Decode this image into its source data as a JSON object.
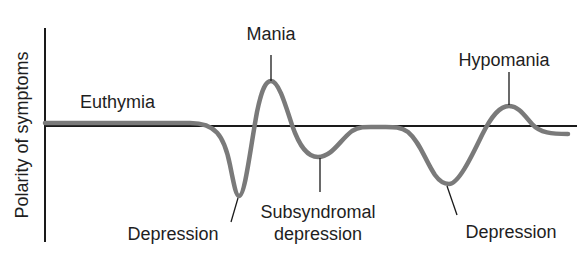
{
  "diagram": {
    "y_axis_label": "Polarity of symptoms",
    "states": {
      "euthymia": "Euthymia",
      "mania": "Mania",
      "depression_1": "Depression",
      "subsyndromal_line1": "Subsyndromal",
      "subsyndromal_line2": "depression",
      "depression_2": "Depression",
      "hypomania": "Hypomania"
    },
    "colors": {
      "axis": "#1a1a1a",
      "curve": "#7a7a7a",
      "text": "#1e1e1e"
    }
  }
}
